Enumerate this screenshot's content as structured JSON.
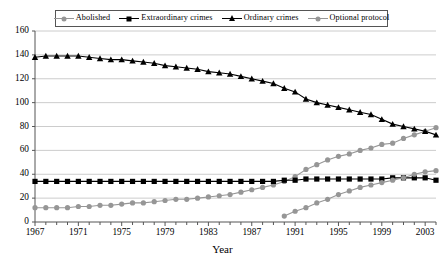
{
  "chart_data": {
    "type": "line",
    "title": "",
    "xlabel": "Year",
    "ylabel": "",
    "xlim": [
      1967,
      2004
    ],
    "ylim": [
      0,
      160
    ],
    "ytick_step": 20,
    "xtick_step": 1,
    "xtick_label_step": 4,
    "grid": true,
    "grid_axis": "y",
    "legend_position": "top-center",
    "yticks": [
      0,
      20,
      40,
      60,
      80,
      100,
      120,
      140,
      160
    ],
    "xticks": [
      1967,
      1968,
      1969,
      1970,
      1971,
      1972,
      1973,
      1974,
      1975,
      1976,
      1977,
      1978,
      1979,
      1980,
      1981,
      1982,
      1983,
      1984,
      1985,
      1986,
      1987,
      1988,
      1989,
      1990,
      1991,
      1992,
      1993,
      1994,
      1995,
      1996,
      1997,
      1998,
      1999,
      2000,
      2001,
      2002,
      2003,
      2004
    ],
    "xtick_labels": [
      "1967",
      "1971",
      "1975",
      "1979",
      "1983",
      "1987",
      "1991",
      "1995",
      "1999",
      "2003"
    ],
    "xtick_label_years": [
      1967,
      1971,
      1975,
      1979,
      1983,
      1987,
      1991,
      1995,
      1999,
      2003
    ],
    "ytick_labels": [
      "0",
      "20",
      "40",
      "60",
      "80",
      "100",
      "120",
      "140",
      "160"
    ],
    "colors": {
      "abolished": "#969696",
      "extraordinary": "#000000",
      "ordinary": "#000000",
      "optional": "#969696",
      "grid": "#bfbfbf",
      "axis": "#555555",
      "background": "#ffffff"
    },
    "series": [
      {
        "name": "Abolished",
        "marker": "circle",
        "color": "#969696",
        "x": [
          1967,
          1968,
          1969,
          1970,
          1971,
          1972,
          1973,
          1974,
          1975,
          1976,
          1977,
          1978,
          1979,
          1980,
          1981,
          1982,
          1983,
          1984,
          1985,
          1986,
          1987,
          1988,
          1989,
          1990,
          1991,
          1992,
          1993,
          1994,
          1995,
          1996,
          1997,
          1998,
          1999,
          2000,
          2001,
          2002,
          2003,
          2004
        ],
        "values": [
          12,
          12,
          12,
          12,
          13,
          13,
          14,
          14,
          15,
          16,
          16,
          17,
          18,
          19,
          19,
          20,
          21,
          22,
          23,
          25,
          27,
          29,
          31,
          34,
          38,
          44,
          48,
          52,
          55,
          57,
          60,
          62,
          65,
          66,
          70,
          73,
          76,
          79
        ]
      },
      {
        "name": "Extraordinary crimes",
        "marker": "square",
        "color": "#000000",
        "x": [
          1967,
          1968,
          1969,
          1970,
          1971,
          1972,
          1973,
          1974,
          1975,
          1976,
          1977,
          1978,
          1979,
          1980,
          1981,
          1982,
          1983,
          1984,
          1985,
          1986,
          1987,
          1988,
          1989,
          1990,
          1991,
          1992,
          1993,
          1994,
          1995,
          1996,
          1997,
          1998,
          1999,
          2000,
          2001,
          2002,
          2003,
          2004
        ],
        "values": [
          34,
          34,
          34,
          34,
          34,
          34,
          34,
          34,
          34,
          34,
          34,
          34,
          34,
          34,
          34,
          34,
          34,
          34,
          34,
          34,
          34,
          34,
          34,
          35,
          35,
          36,
          36,
          36,
          36,
          36,
          36,
          36,
          36,
          37,
          37,
          37,
          37,
          35
        ]
      },
      {
        "name": "Ordinary crimes",
        "marker": "triangle",
        "color": "#000000",
        "x": [
          1967,
          1968,
          1969,
          1970,
          1971,
          1972,
          1973,
          1974,
          1975,
          1976,
          1977,
          1978,
          1979,
          1980,
          1981,
          1982,
          1983,
          1984,
          1985,
          1986,
          1987,
          1988,
          1989,
          1990,
          1991,
          1992,
          1993,
          1994,
          1995,
          1996,
          1997,
          1998,
          1999,
          2000,
          2001,
          2002,
          2003,
          2004
        ],
        "values": [
          138,
          139,
          139,
          139,
          139,
          138,
          137,
          136,
          136,
          135,
          134,
          133,
          131,
          130,
          129,
          128,
          126,
          125,
          124,
          122,
          120,
          118,
          116,
          112,
          109,
          103,
          100,
          98,
          96,
          94,
          92,
          90,
          86,
          82,
          80,
          78,
          76,
          73
        ]
      },
      {
        "name": "Optional protocol",
        "marker": "circle",
        "color": "#969696",
        "x": [
          1990,
          1991,
          1992,
          1993,
          1994,
          1995,
          1996,
          1997,
          1998,
          1999,
          2000,
          2001,
          2002,
          2003,
          2004
        ],
        "values": [
          5,
          9,
          12,
          16,
          19,
          23,
          26,
          29,
          31,
          33,
          35,
          37,
          40,
          42,
          43
        ]
      }
    ]
  },
  "legend": {
    "entries": [
      {
        "label": "Abolished",
        "marker": "circle",
        "color": "#969696"
      },
      {
        "label": "Extraordinary crimes",
        "marker": "square",
        "color": "#000000"
      },
      {
        "label": "Ordinary crimes",
        "marker": "triangle",
        "color": "#000000"
      },
      {
        "label": "Optional protocol",
        "marker": "circle",
        "color": "#969696"
      }
    ]
  },
  "axes": {
    "x_title": "Year"
  }
}
